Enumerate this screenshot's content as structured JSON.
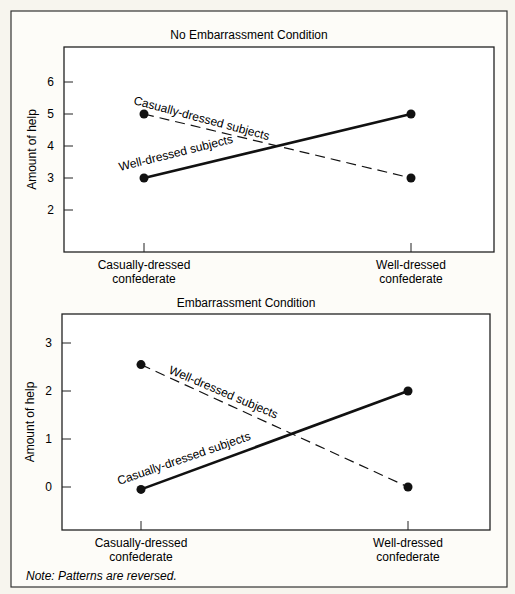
{
  "chart_data": [
    {
      "type": "line",
      "title": "No Embarrassment Condition",
      "xlabel": "",
      "ylabel": "Amount of help",
      "categories": [
        "Casually-dressed\nconfederate",
        "Well-dressed\nconfederate"
      ],
      "category_lines": [
        [
          "Casually-dressed",
          "confederate"
        ],
        [
          "Well-dressed",
          "confederate"
        ]
      ],
      "yticks": [
        2,
        3,
        4,
        5,
        6
      ],
      "ylim": [
        0.9,
        7.0
      ],
      "grid": false,
      "legend": "inline labels",
      "series": [
        {
          "name": "Casually-dressed subjects",
          "style": "dashed",
          "values": [
            5,
            3
          ]
        },
        {
          "name": "Well-dressed subjects",
          "style": "solid",
          "values": [
            3,
            5
          ]
        }
      ]
    },
    {
      "type": "line",
      "title": "Embarrassment Condition",
      "xlabel": "",
      "ylabel": "Amount of help",
      "categories": [
        "Casually-dressed\nconfederate",
        "Well-dressed\nconfederate"
      ],
      "category_lines": [
        [
          "Casually-dressed",
          "confederate"
        ],
        [
          "Well-dressed",
          "confederate"
        ]
      ],
      "yticks": [
        0,
        1,
        2,
        3
      ],
      "ylim": [
        -0.85,
        3.65
      ],
      "grid": false,
      "legend": "inline labels",
      "series": [
        {
          "name": "Well-dressed subjects",
          "style": "dashed",
          "values": [
            2.55,
            0
          ]
        },
        {
          "name": "Casually-dressed subjects",
          "style": "solid",
          "values": [
            -0.05,
            2
          ]
        }
      ]
    }
  ],
  "note": "Note: Patterns are reversed.",
  "colors": {
    "background": "#f7f5ee",
    "plot_bg": "#ffffff",
    "ink": "#1a1a1a"
  }
}
